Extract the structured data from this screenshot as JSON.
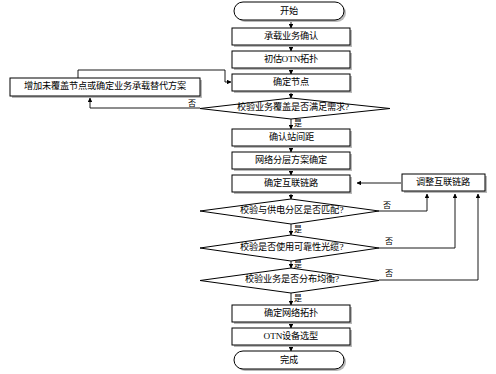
{
  "diagram": {
    "orientation": "top-to-bottom",
    "nodes": [
      {
        "id": "start",
        "shape": "rounded-rect",
        "label": "开始"
      },
      {
        "id": "confirm_svc",
        "shape": "rect",
        "label": "承载业务确认"
      },
      {
        "id": "est_topo",
        "shape": "rect",
        "label": "初估OTN拓扑"
      },
      {
        "id": "det_nodes",
        "shape": "rect",
        "label": "确定节点"
      },
      {
        "id": "alt_plan",
        "shape": "rect",
        "label": "增加未覆盖节点或确定业务承载替代方案"
      },
      {
        "id": "chk_cover",
        "shape": "diamond",
        "label": "校验业务覆盖是否满足需求?"
      },
      {
        "id": "station_gap",
        "shape": "rect",
        "label": "确认站间距"
      },
      {
        "id": "layer_plan",
        "shape": "rect",
        "label": "网络分层方案确定"
      },
      {
        "id": "det_links",
        "shape": "rect",
        "label": "确定互联链路"
      },
      {
        "id": "adj_links",
        "shape": "rect",
        "label": "调整互联链路"
      },
      {
        "id": "chk_power",
        "shape": "diamond",
        "label": "校验与供电分区是否匹配?"
      },
      {
        "id": "chk_fiber",
        "shape": "diamond",
        "label": "校验是否使用可靠性光缆?"
      },
      {
        "id": "chk_balance",
        "shape": "diamond",
        "label": "校验业务是否分布均衡?"
      },
      {
        "id": "det_topo",
        "shape": "rect",
        "label": "确定网络拓扑"
      },
      {
        "id": "otn_select",
        "shape": "rect",
        "label": "OTN设备选型"
      },
      {
        "id": "finish",
        "shape": "rounded-rect",
        "label": "完成"
      }
    ],
    "edge_labels": {
      "yes": "是",
      "no": "否"
    },
    "edges": [
      {
        "from": "start",
        "to": "confirm_svc",
        "label": ""
      },
      {
        "from": "confirm_svc",
        "to": "est_topo",
        "label": ""
      },
      {
        "from": "est_topo",
        "to": "det_nodes",
        "label": ""
      },
      {
        "from": "det_nodes",
        "to": "chk_cover",
        "label": ""
      },
      {
        "from": "chk_cover",
        "to": "alt_plan",
        "label": "否"
      },
      {
        "from": "alt_plan",
        "to": "det_nodes",
        "label": ""
      },
      {
        "from": "chk_cover",
        "to": "station_gap",
        "label": "是"
      },
      {
        "from": "station_gap",
        "to": "layer_plan",
        "label": ""
      },
      {
        "from": "layer_plan",
        "to": "det_links",
        "label": ""
      },
      {
        "from": "det_links",
        "to": "chk_power",
        "label": ""
      },
      {
        "from": "chk_power",
        "to": "adj_links",
        "label": "否"
      },
      {
        "from": "chk_power",
        "to": "chk_fiber",
        "label": "是"
      },
      {
        "from": "chk_fiber",
        "to": "adj_links",
        "label": "否"
      },
      {
        "from": "chk_fiber",
        "to": "chk_balance",
        "label": "是"
      },
      {
        "from": "chk_balance",
        "to": "adj_links",
        "label": "否"
      },
      {
        "from": "chk_balance",
        "to": "det_topo",
        "label": "是"
      },
      {
        "from": "adj_links",
        "to": "det_links",
        "label": ""
      },
      {
        "from": "det_topo",
        "to": "otn_select",
        "label": ""
      },
      {
        "from": "otn_select",
        "to": "finish",
        "label": ""
      }
    ],
    "colors": {
      "background": "#ffffff",
      "stroke": "#000000",
      "fill": "#ffffff",
      "shadow": "#b9b9b9",
      "text": "#000000"
    }
  }
}
